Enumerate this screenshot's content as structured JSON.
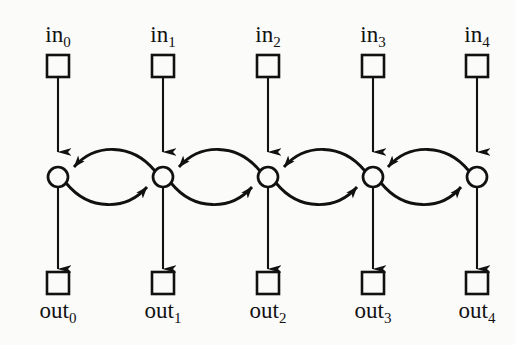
{
  "diagram": {
    "background_color": "#fbfbfa",
    "stroke_color": "#111111",
    "columns": [
      {
        "index": 0,
        "x": 58,
        "in_label_text": "in",
        "in_label_sub": "0",
        "out_label_text": "out",
        "out_label_sub": "0"
      },
      {
        "index": 1,
        "x": 163,
        "in_label_text": "in",
        "in_label_sub": "1",
        "out_label_text": "out",
        "out_label_sub": "1"
      },
      {
        "index": 2,
        "x": 268,
        "in_label_text": "in",
        "in_label_sub": "2",
        "out_label_text": "out",
        "out_label_sub": "2"
      },
      {
        "index": 3,
        "x": 373,
        "in_label_text": "in",
        "in_label_sub": "3",
        "out_label_text": "out",
        "out_label_sub": "3"
      },
      {
        "index": 4,
        "x": 477,
        "in_label_text": "in",
        "in_label_sub": "4",
        "out_label_text": "out",
        "out_label_sub": "4"
      }
    ],
    "geometry": {
      "in_label_y": 42,
      "in_box_y": 55,
      "box_size": 22,
      "node_y": 177,
      "node_radius": 10,
      "out_box_y": 272,
      "out_label_y": 300
    },
    "icons": {
      "input_port": "square-port-icon",
      "unit": "circle-node-icon",
      "output_port": "square-port-icon",
      "down_arrow": "arrow-down-icon",
      "left_arrow": "arrow-left-curve-icon",
      "right_arrow": "arrow-right-curve-icon"
    }
  }
}
